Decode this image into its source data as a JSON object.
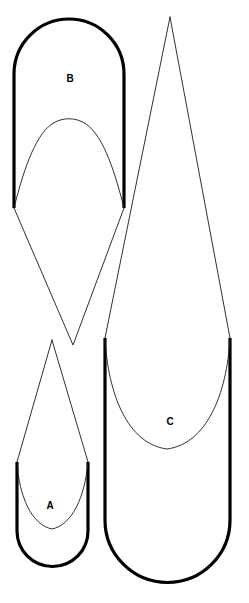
{
  "figure": {
    "background_color": "#ffffff",
    "stroke_color": "#000000",
    "thin_stroke_color": "#1a1a1a",
    "width": 249,
    "height": 603
  },
  "labels": {
    "a": "A",
    "b": "B",
    "c": "C"
  },
  "shapes": [
    {
      "id": "b",
      "label": "B",
      "label_x": 70,
      "label_y": 79,
      "description": "thick stadium with rounded top and inner thin dome",
      "thick_outline_path": "M 14 208 L 14 74 A 55 55 0 0 1 124 74 L 124 208",
      "thin_inner_path": "M 14 208 C 22 176 34 136 52 124 C 62 117 76 117 86 124 C 104 136 116 176 124 208",
      "thick_top_y": 20,
      "thick_bottom_y": 208,
      "thick_left_x": 14,
      "thick_right_x": 124
    },
    {
      "id": "a",
      "label": "A",
      "label_x": 50,
      "label_y": 506,
      "description": "thin triangle apex with thick stadium bottom and inner thin U",
      "thick_outline_path": "M 17 462 L 17 531 A 35.5 35.5 0 0 0 88 531 L 88 462",
      "thin_inner_path": "M 17 462 C 19 497 32 525 52 529 C 72 525 85 497 88 462",
      "thin_apex_path": "M 52 340 L 17 462 M 52 340 L 88 462",
      "apex_x": 52,
      "apex_y": 340,
      "thick_left_x": 17,
      "thick_right_x": 88,
      "thick_top_y": 462,
      "thick_bottom_y": 566
    },
    {
      "id": "c",
      "label": "C",
      "label_x": 170,
      "label_y": 422,
      "description": "thin triangle apex with tall thick stadium bottom and inner thin U",
      "thick_outline_path": "M 105 338 L 105 520 A 62.5 62.5 0 0 0 230 520 L 230 338",
      "thin_inner_path": "M 105 338 C 108 395 128 444 167 449 C 206 444 227 395 230 338",
      "thin_apex_path": "M 170 17 L 105 338 M 170 17 L 230 338",
      "apex_x": 170,
      "apex_y": 17,
      "thick_left_x": 105,
      "thick_right_x": 230,
      "thick_top_y": 338,
      "thick_bottom_y": 582
    }
  ],
  "connectors": [
    {
      "id": "b-lower-vee",
      "description": "thin lines from B bottom corners converging to a point below",
      "path": "M 14 208 L 73 345 L 124 208",
      "vertex_x": 73,
      "vertex_y": 345
    }
  ]
}
